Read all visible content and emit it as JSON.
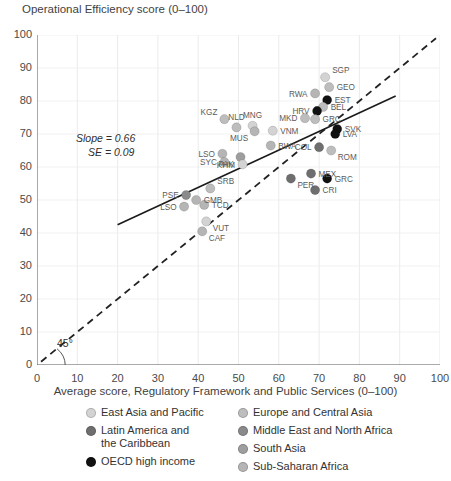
{
  "axes": {
    "y_title": "Operational Efficiency score (0–100)",
    "x_title": "Average score, Regulatory Framework and Public Services (0–100)",
    "y_ticks": [
      "100",
      "90",
      "80",
      "70",
      "60",
      "50",
      "40",
      "30",
      "20",
      "10",
      "0"
    ],
    "x_ticks": [
      "0",
      "10",
      "20",
      "30",
      "40",
      "50",
      "60",
      "70",
      "80",
      "90",
      "100"
    ]
  },
  "annotations": {
    "slope": "Slope = 0.66",
    "se": "SE = 0.09",
    "angle": "45°"
  },
  "legend": {
    "column1": [
      {
        "label": "East Asia and Pacific",
        "color": "#d3d3d3"
      },
      {
        "label": "Latin America and",
        "label2": "the Caribbean",
        "color": "#6e6e6e"
      },
      {
        "label": "OECD high income",
        "color": "#111111"
      }
    ],
    "column2": [
      {
        "label": "Europe and Central Asia",
        "color": "#bdbdbd"
      },
      {
        "label": "Middle East and North Africa",
        "color": "#8a8a8a"
      },
      {
        "label": "South Asia",
        "color": "#9e9e9e"
      },
      {
        "label": "Sub-Saharan Africa",
        "color": "#b5b5b5"
      }
    ]
  },
  "chart_data": {
    "type": "scatter",
    "title": "",
    "xlabel": "Average score, Regulatory Framework and Public Services (0–100)",
    "ylabel": "Operational Efficiency score (0–100)",
    "xlim": [
      0,
      100
    ],
    "ylim": [
      0,
      100
    ],
    "xticks": [
      0,
      10,
      20,
      30,
      40,
      50,
      60,
      70,
      80,
      90,
      100
    ],
    "yticks": [
      0,
      10,
      20,
      30,
      40,
      50,
      60,
      70,
      80,
      90,
      100
    ],
    "grid": true,
    "legend_position": "below",
    "fit_line": {
      "slope": 0.66,
      "se": 0.09,
      "x_start": 20,
      "y_start": 42.5,
      "x_end": 89,
      "y_end": 81.5,
      "style": "solid"
    },
    "reference_line": {
      "label": "45°",
      "slope": 1,
      "intercept": 0,
      "style": "dashed",
      "x_start": 1,
      "x_end": 99
    },
    "groups": [
      {
        "name": "East Asia and Pacific",
        "color": "#d3d3d3"
      },
      {
        "name": "Europe and Central Asia",
        "color": "#bdbdbd"
      },
      {
        "name": "Latin America and the Caribbean",
        "color": "#6e6e6e"
      },
      {
        "name": "Middle East and North Africa",
        "color": "#8a8a8a"
      },
      {
        "name": "South Asia",
        "color": "#9e9e9e"
      },
      {
        "name": "Sub-Saharan Africa",
        "color": "#b5b5b5"
      },
      {
        "name": "OECD high income",
        "color": "#111111"
      }
    ],
    "points": [
      {
        "code": "SGP",
        "x": 71.5,
        "y": 87.2,
        "group": "East Asia and Pacific",
        "lp": "ne"
      },
      {
        "code": "GEO",
        "x": 72.5,
        "y": 84.2,
        "group": "Europe and Central Asia",
        "lp": "e"
      },
      {
        "code": "RWA",
        "x": 69.0,
        "y": 82.3,
        "group": "Sub-Saharan Africa",
        "lp": "w"
      },
      {
        "code": "EST",
        "x": 72.0,
        "y": 80.3,
        "group": "OECD high income",
        "lp": "e"
      },
      {
        "code": "BEL",
        "x": 71.0,
        "y": 78.2,
        "group": "Europe and Central Asia",
        "lp": "e"
      },
      {
        "code": "HRV",
        "x": 69.5,
        "y": 77.0,
        "group": "OECD high income",
        "lp": "w"
      },
      {
        "code": "MKD",
        "x": 66.5,
        "y": 74.8,
        "group": "Europe and Central Asia",
        "lp": "w"
      },
      {
        "code": "GRC",
        "x": 69.0,
        "y": 74.5,
        "group": "Europe and Central Asia",
        "lp": "e"
      },
      {
        "code": "KGZ",
        "x": 46.5,
        "y": 74.5,
        "group": "Europe and Central Asia",
        "lp": "nw"
      },
      {
        "code": "MNG",
        "x": 53.5,
        "y": 72.5,
        "group": "East Asia and Pacific",
        "lp": "n"
      },
      {
        "code": "MUS",
        "x": 54.0,
        "y": 70.8,
        "group": "Sub-Saharan Africa",
        "lp": "sw"
      },
      {
        "code": "VNM",
        "x": 58.5,
        "y": 71.0,
        "group": "East Asia and Pacific",
        "lp": "e"
      },
      {
        "code": "SVK",
        "x": 74.5,
        "y": 71.5,
        "group": "OECD high income",
        "lp": "e"
      },
      {
        "code": "LVA",
        "x": 74.0,
        "y": 70.0,
        "group": "OECD high income",
        "lp": "e"
      },
      {
        "code": "NLD",
        "x": 49.5,
        "y": 72.0,
        "group": "Europe and Central Asia",
        "lp": "n"
      },
      {
        "code": "COL",
        "x": 70.0,
        "y": 66.0,
        "group": "Latin America and the Caribbean",
        "lp": "w"
      },
      {
        "code": "ROM",
        "x": 73.0,
        "y": 65.0,
        "group": "Europe and Central Asia",
        "lp": "se"
      },
      {
        "code": "BWA",
        "x": 58.0,
        "y": 66.5,
        "group": "Sub-Saharan Africa",
        "lp": "e"
      },
      {
        "code": "LSO",
        "x": 46.0,
        "y": 64.0,
        "group": "Sub-Saharan Africa",
        "lp": "w"
      },
      {
        "code": "SYC",
        "x": 46.5,
        "y": 61.5,
        "group": "Sub-Saharan Africa",
        "lp": "w"
      },
      {
        "code": "PAK",
        "x": 50.5,
        "y": 63.0,
        "group": "South Asia",
        "lp": "sw"
      },
      {
        "code": "KHM",
        "x": 51.0,
        "y": 60.8,
        "group": "East Asia and Pacific",
        "lp": "w"
      },
      {
        "code": "MEX",
        "x": 68.0,
        "y": 58.0,
        "group": "Latin America and the Caribbean",
        "lp": "e"
      },
      {
        "code": "PER",
        "x": 63.0,
        "y": 56.5,
        "group": "Latin America and the Caribbean",
        "lp": "se"
      },
      {
        "code": "GRC2",
        "x": 72.0,
        "y": 56.5,
        "group": "OECD high income",
        "lp": "e"
      },
      {
        "code": "CRI",
        "x": 69.0,
        "y": 53.0,
        "group": "Latin America and the Caribbean",
        "lp": "e"
      },
      {
        "code": "SRB",
        "x": 43.0,
        "y": 53.5,
        "group": "Europe and Central Asia",
        "lp": "ne"
      },
      {
        "code": "PSE",
        "x": 37.0,
        "y": 51.5,
        "group": "Middle East and North Africa",
        "lp": "w"
      },
      {
        "code": "GMB",
        "x": 39.5,
        "y": 50.0,
        "group": "Sub-Saharan Africa",
        "lp": "e"
      },
      {
        "code": "TCD",
        "x": 41.5,
        "y": 48.5,
        "group": "Sub-Saharan Africa",
        "lp": "e"
      },
      {
        "code": "LSO2",
        "x": 36.5,
        "y": 48.0,
        "group": "Sub-Saharan Africa",
        "lp": "w"
      },
      {
        "code": "VUT",
        "x": 42.0,
        "y": 43.5,
        "group": "East Asia and Pacific",
        "lp": "se"
      },
      {
        "code": "CAF",
        "x": 41.0,
        "y": 40.5,
        "group": "Sub-Saharan Africa",
        "lp": "se"
      }
    ]
  }
}
